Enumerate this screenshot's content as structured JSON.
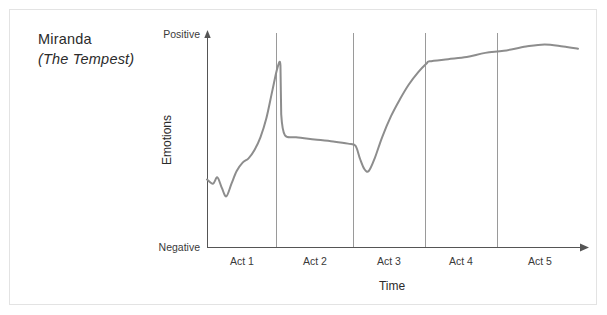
{
  "title": {
    "character": "Miranda",
    "work": "(The Tempest)"
  },
  "colors": {
    "curve": "#8d8d8d",
    "axis": "#555555",
    "divider": "#9a9a9a",
    "frame": "#e3e3e3",
    "text": "#2b2b2b"
  },
  "chart_data": {
    "type": "line",
    "title": "Miranda (The Tempest)",
    "xlabel": "Time",
    "ylabel": "Emotions",
    "x_tick_labels": [
      "Act 1",
      "Act 2",
      "Act 3",
      "Act 4",
      "Act 5"
    ],
    "y_tick_labels": [
      "Negative",
      "Positive"
    ],
    "ylim": [
      0,
      100
    ],
    "xlim": [
      0,
      5
    ],
    "grid": false,
    "legend": null,
    "axis_arrows": true,
    "act_dividers": [
      1,
      2,
      3,
      4
    ],
    "series": [
      {
        "name": "Miranda emotional arc",
        "points": [
          [
            0.0,
            32
          ],
          [
            0.08,
            30
          ],
          [
            0.14,
            33
          ],
          [
            0.2,
            28
          ],
          [
            0.26,
            24
          ],
          [
            0.33,
            30
          ],
          [
            0.4,
            36
          ],
          [
            0.48,
            40
          ],
          [
            0.56,
            42
          ],
          [
            0.64,
            46
          ],
          [
            0.72,
            52
          ],
          [
            0.8,
            61
          ],
          [
            0.88,
            74
          ],
          [
            0.95,
            85
          ],
          [
            0.99,
            86
          ],
          [
            1.0,
            63
          ],
          [
            1.05,
            53
          ],
          [
            1.2,
            52
          ],
          [
            1.45,
            51
          ],
          [
            1.7,
            50
          ],
          [
            1.9,
            49
          ],
          [
            2.0,
            48
          ],
          [
            2.06,
            42
          ],
          [
            2.12,
            37
          ],
          [
            2.18,
            36
          ],
          [
            2.26,
            42
          ],
          [
            2.36,
            52
          ],
          [
            2.48,
            62
          ],
          [
            2.6,
            70
          ],
          [
            2.72,
            77
          ],
          [
            2.85,
            83
          ],
          [
            2.96,
            87
          ],
          [
            3.0,
            88
          ],
          [
            3.25,
            89
          ],
          [
            3.5,
            90
          ],
          [
            3.75,
            92
          ],
          [
            4.0,
            93
          ],
          [
            4.3,
            95
          ],
          [
            4.55,
            96
          ],
          [
            4.8,
            95
          ],
          [
            5.0,
            94
          ]
        ]
      }
    ],
    "annotations": []
  }
}
